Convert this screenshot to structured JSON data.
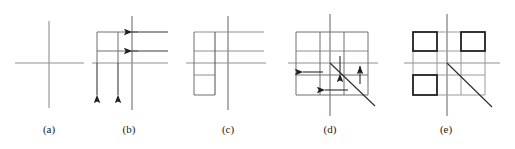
{
  "figure": {
    "kind": "line-diagram",
    "width": 515,
    "height": 149,
    "background_color": "#ffffff",
    "stroke_color": "#2b2b2b",
    "light_stroke_color": "#8c8c8c",
    "bold_stroke_color": "#1a1a1a",
    "caption_sequence": "(a) (b) (c) (d) (e)"
  },
  "labels": [
    {
      "id": "a",
      "text": "(a)",
      "x": 49,
      "y": 130
    },
    {
      "id": "b",
      "text": "(b)",
      "x": 129,
      "y": 130
    },
    {
      "id": "c",
      "text": "(c)",
      "x": 228,
      "y": 130
    },
    {
      "id": "d",
      "text": "(d)",
      "x": 330,
      "y": 130
    },
    {
      "id": "e",
      "text": "(e)",
      "x": 446,
      "y": 130
    }
  ],
  "panels": [
    {
      "id": "a",
      "name": "panel-a-cross",
      "description": "A single pair of crossed axes with no grid cells, no arrows and no diagonal.",
      "grid_cells": 0,
      "arrows": 0,
      "diagonal": false,
      "bold_cells": 0
    },
    {
      "id": "b",
      "name": "panel-b-grid-with-arrows",
      "description": "Crossed axes overlaid with a partial rectangular grid; two arrows point down on the left verticals and two arrows point right along the horizontals.",
      "grid_cells": 4,
      "arrows": 4,
      "arrow_directions": [
        "down",
        "down",
        "right",
        "right"
      ],
      "diagonal": false,
      "bold_cells": 0
    },
    {
      "id": "c",
      "name": "panel-c-grid-no-arrows",
      "description": "Crossed axes overlaid with a partial rectangular grid; the arrowheads have been removed leaving plain segments of differing lengths.",
      "grid_cells": 4,
      "arrows": 0,
      "diagonal": false,
      "bold_cells": 0
    },
    {
      "id": "d",
      "name": "panel-d-grid-with-diagonal-and-arrows",
      "description": "Crossed axes over a three-by-three grid with a diagonal running down to the right; four arrowheads mark directions right, down, up and right.",
      "grid_cells": 9,
      "arrows": 4,
      "arrow_directions": [
        "right",
        "down",
        "up",
        "right"
      ],
      "diagonal": true,
      "bold_cells": 0
    },
    {
      "id": "e",
      "name": "panel-e-grid-with-bold-cells",
      "description": "Crossed axes over a three-by-three grid with a diagonal running down to the right; three cells are outlined in bold at top-left, top-right and bottom-left.",
      "grid_cells": 9,
      "arrows": 0,
      "diagonal": true,
      "bold_cells": 3,
      "bold_cell_positions": [
        "top-left",
        "top-right",
        "bottom-left"
      ]
    }
  ]
}
